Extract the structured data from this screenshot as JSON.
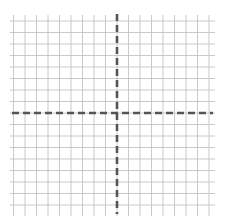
{
  "diagram": {
    "type": "coordinate-grid",
    "background": "#ffffff",
    "grid": {
      "x_start": 10,
      "y_start": 15,
      "x_end": 215,
      "y_end": 216,
      "spacing": 11.5,
      "columns": 18,
      "rows": 17,
      "line_color": "#bdbdbd",
      "line_width": 0.8
    },
    "axes": {
      "origin_x": 117,
      "origin_y": 113,
      "color": "#555555",
      "width": 2.6,
      "dash": "7 4",
      "x_axis": {
        "x1": 12,
        "x2": 213
      },
      "y_axis": {
        "y1": 14,
        "y2": 214
      }
    }
  }
}
